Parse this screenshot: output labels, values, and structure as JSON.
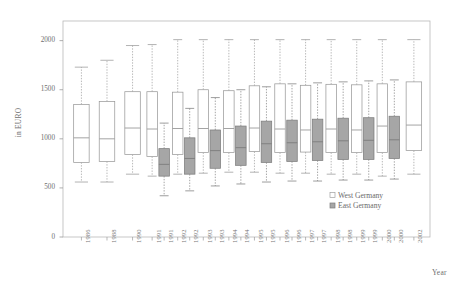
{
  "chart_data": {
    "type": "box",
    "title": "",
    "xlabel": "Year",
    "ylabel": "in EURO",
    "ylim": [
      0,
      2200
    ],
    "yticks": [
      0,
      500,
      1000,
      1500,
      2000
    ],
    "ytick_labels": [
      "0",
      "500",
      "1000",
      "1500",
      "2000"
    ],
    "grid": false,
    "legend_position": "bottom-right",
    "categories": [
      "1986",
      "1988",
      "1990",
      "1991",
      "1992",
      "1993",
      "1994",
      "1995",
      "1996",
      "1997",
      "1998",
      "1999",
      "2000",
      "2002"
    ],
    "series": [
      {
        "name": "West Germany",
        "color": "#ffffff",
        "edge_color": "#9a9a9a",
        "boxes": [
          {
            "category": "1986",
            "whisker_low": 560,
            "q1": 760,
            "median": 1010,
            "q3": 1350,
            "whisker_high": 1730
          },
          {
            "category": "1988",
            "whisker_low": 560,
            "q1": 770,
            "median": 1000,
            "q3": 1380,
            "whisker_high": 1800
          },
          {
            "category": "1990",
            "whisker_low": 640,
            "q1": 840,
            "median": 1110,
            "q3": 1480,
            "whisker_high": 1950
          },
          {
            "category": "1991",
            "whisker_low": 620,
            "q1": 820,
            "median": 1100,
            "q3": 1480,
            "whisker_high": 1960
          },
          {
            "category": "1992",
            "whisker_low": 640,
            "q1": 840,
            "median": 1105,
            "q3": 1475,
            "whisker_high": 2010
          },
          {
            "category": "1993",
            "whisker_low": 650,
            "q1": 860,
            "median": 1105,
            "q3": 1500,
            "whisker_high": 2010
          },
          {
            "category": "1994",
            "whisker_low": 660,
            "q1": 860,
            "median": 1105,
            "q3": 1490,
            "whisker_high": 2010
          },
          {
            "category": "1995",
            "whisker_low": 660,
            "q1": 870,
            "median": 1110,
            "q3": 1540,
            "whisker_high": 2010
          },
          {
            "category": "1996",
            "whisker_low": 650,
            "q1": 860,
            "median": 1100,
            "q3": 1560,
            "whisker_high": 2010
          },
          {
            "category": "1997",
            "whisker_low": 650,
            "q1": 865,
            "median": 1090,
            "q3": 1545,
            "whisker_high": 2010
          },
          {
            "category": "1998",
            "whisker_low": 640,
            "q1": 860,
            "median": 1100,
            "q3": 1555,
            "whisker_high": 2010
          },
          {
            "category": "1999",
            "whisker_low": 640,
            "q1": 860,
            "median": 1090,
            "q3": 1550,
            "whisker_high": 2010
          },
          {
            "category": "2000",
            "whisker_low": 620,
            "q1": 860,
            "median": 1130,
            "q3": 1560,
            "whisker_high": 2010
          },
          {
            "category": "2002",
            "whisker_low": 640,
            "q1": 880,
            "median": 1140,
            "q3": 1580,
            "whisker_high": 2010
          }
        ]
      },
      {
        "name": "East Germany",
        "color": "#a6a6a6",
        "edge_color": "#7d7d7d",
        "boxes": [
          {
            "category": "1991",
            "whisker_low": 420,
            "q1": 620,
            "median": 740,
            "q3": 900,
            "whisker_high": 1160
          },
          {
            "category": "1992",
            "whisker_low": 470,
            "q1": 640,
            "median": 800,
            "q3": 1010,
            "whisker_high": 1310
          },
          {
            "category": "1993",
            "whisker_low": 520,
            "q1": 700,
            "median": 880,
            "q3": 1090,
            "whisker_high": 1420
          },
          {
            "category": "1994",
            "whisker_low": 540,
            "q1": 730,
            "median": 910,
            "q3": 1130,
            "whisker_high": 1500
          },
          {
            "category": "1995",
            "whisker_low": 560,
            "q1": 760,
            "median": 950,
            "q3": 1180,
            "whisker_high": 1530
          },
          {
            "category": "1996",
            "whisker_low": 570,
            "q1": 770,
            "median": 960,
            "q3": 1190,
            "whisker_high": 1560
          },
          {
            "category": "1997",
            "whisker_low": 570,
            "q1": 780,
            "median": 970,
            "q3": 1200,
            "whisker_high": 1570
          },
          {
            "category": "1998",
            "whisker_low": 580,
            "q1": 790,
            "median": 980,
            "q3": 1210,
            "whisker_high": 1580
          },
          {
            "category": "1999",
            "whisker_low": 580,
            "q1": 790,
            "median": 985,
            "q3": 1215,
            "whisker_high": 1590
          },
          {
            "category": "2000",
            "whisker_low": 590,
            "q1": 800,
            "median": 990,
            "q3": 1230,
            "whisker_high": 1600
          }
        ]
      }
    ]
  },
  "legend": {
    "items": [
      {
        "label": "West Germany",
        "swatch": "#ffffff"
      },
      {
        "label": "East Germany",
        "swatch": "#a6a6a6"
      }
    ]
  }
}
